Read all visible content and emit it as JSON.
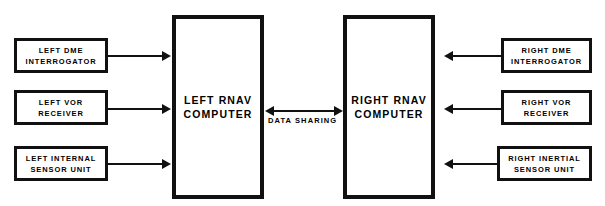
{
  "diagram": {
    "background_color": "#ffffff",
    "line_color": "#111111",
    "left_inputs": [
      {
        "line1": "LEFT DME",
        "line2": "INTERROGATOR"
      },
      {
        "line1": "LEFT VOR",
        "line2": "RECEIVER"
      },
      {
        "line1": "LEFT INTERNAL",
        "line2": "SENSOR UNIT"
      }
    ],
    "right_inputs": [
      {
        "line1": "RIGHT DME",
        "line2": "INTERROGATOR"
      },
      {
        "line1": "RIGHT VOR",
        "line2": "RECEIVER"
      },
      {
        "line1": "RIGHT INERTIAL",
        "line2": "SENSOR UNIT"
      }
    ],
    "left_computer": {
      "line1": "LEFT RNAV",
      "line2": "COMPUTER"
    },
    "right_computer": {
      "line1": "RIGHT RNAV",
      "line2": "COMPUTER"
    },
    "data_sharing_label": "DATA SHARING"
  }
}
